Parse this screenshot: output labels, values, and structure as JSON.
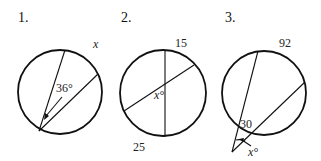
{
  "problems": [
    {
      "number": "1.",
      "arc_label": "x",
      "angle_label": "36°",
      "type": "inscribed angle"
    },
    {
      "number": "2.",
      "arc_top_label": "15",
      "arc_bottom_label": "25",
      "angle_label": "x°",
      "type": "intersecting chords"
    },
    {
      "number": "3.",
      "far_arc_label": "92",
      "near_arc_label": "30",
      "angle_label": "x°",
      "type": "two secants from external point"
    }
  ]
}
